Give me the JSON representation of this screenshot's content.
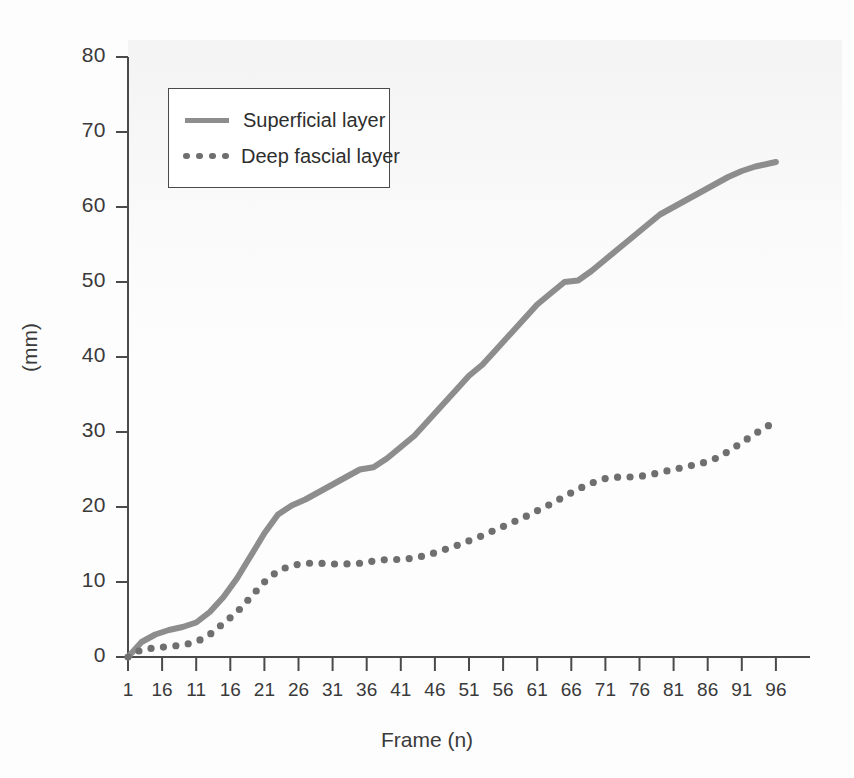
{
  "chart_data": {
    "type": "line",
    "title": "",
    "xlabel": "Frame (n)",
    "ylabel": "(mm)",
    "xlim": [
      1,
      101
    ],
    "ylim": [
      0,
      80
    ],
    "grid": false,
    "legend_position": "top-left",
    "ytick_labels": [
      "0",
      "10",
      "20",
      "30",
      "40",
      "50",
      "60",
      "70",
      "80"
    ],
    "ytick_values": [
      0,
      10,
      20,
      30,
      40,
      50,
      60,
      70,
      80
    ],
    "xtick_labels": [
      "1",
      "16",
      "11",
      "16",
      "21",
      "26",
      "31",
      "36",
      "41",
      "46",
      "51",
      "56",
      "61",
      "66",
      "71",
      "76",
      "81",
      "86",
      "91",
      "96"
    ],
    "xtick_values": [
      1,
      6,
      11,
      16,
      21,
      26,
      31,
      36,
      41,
      46,
      51,
      56,
      61,
      66,
      71,
      76,
      81,
      86,
      91,
      96
    ],
    "series": [
      {
        "name": "Superficial layer",
        "style": "solid",
        "color": "#8d8d8d",
        "x": [
          1,
          3,
          5,
          7,
          9,
          11,
          13,
          15,
          17,
          19,
          21,
          23,
          25,
          27,
          29,
          31,
          33,
          35,
          37,
          39,
          41,
          43,
          45,
          47,
          49,
          51,
          53,
          55,
          57,
          59,
          61,
          63,
          65,
          67,
          69,
          71,
          73,
          75,
          77,
          79,
          81,
          83,
          85,
          87,
          89,
          91,
          93,
          95,
          96
        ],
        "values": [
          0.0,
          2.0,
          3.0,
          3.6,
          4.0,
          4.6,
          6.0,
          8.0,
          10.5,
          13.5,
          16.5,
          19.0,
          20.2,
          21.0,
          22.0,
          23.0,
          24.0,
          25.0,
          25.3,
          26.5,
          28.0,
          29.5,
          31.5,
          33.5,
          35.5,
          37.5,
          39.0,
          41.0,
          43.0,
          45.0,
          47.0,
          48.5,
          50.0,
          50.2,
          51.5,
          53.0,
          54.5,
          56.0,
          57.5,
          59.0,
          60.0,
          61.0,
          62.0,
          63.0,
          64.0,
          64.8,
          65.4,
          65.8,
          66.0
        ]
      },
      {
        "name": "Deep fascial layer",
        "style": "dotted",
        "color": "#6f6f6f",
        "x": [
          1,
          3,
          5,
          7,
          9,
          11,
          13,
          15,
          17,
          19,
          21,
          23,
          25,
          27,
          29,
          31,
          33,
          35,
          37,
          39,
          41,
          43,
          45,
          47,
          49,
          51,
          53,
          55,
          57,
          59,
          61,
          63,
          65,
          67,
          69,
          71,
          73,
          75,
          77,
          79,
          81,
          83,
          85,
          87,
          89,
          91,
          93,
          95,
          96
        ],
        "values": [
          0.0,
          1.0,
          1.2,
          1.4,
          1.6,
          2.0,
          3.0,
          4.5,
          6.0,
          8.0,
          10.0,
          11.5,
          12.2,
          12.5,
          12.5,
          12.4,
          12.4,
          12.5,
          12.8,
          13.0,
          13.0,
          13.2,
          13.6,
          14.2,
          14.8,
          15.5,
          16.2,
          17.0,
          17.8,
          18.6,
          19.5,
          20.4,
          21.4,
          22.4,
          23.2,
          23.8,
          24.0,
          24.0,
          24.2,
          24.6,
          25.0,
          25.4,
          25.8,
          26.4,
          27.4,
          28.6,
          29.8,
          30.9,
          31.5
        ]
      }
    ]
  }
}
